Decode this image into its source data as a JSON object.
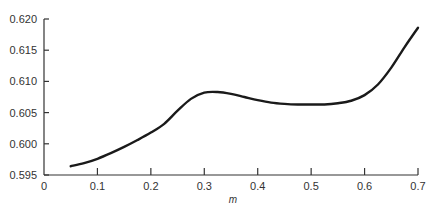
{
  "chart_data": {
    "type": "line",
    "title": "",
    "xlabel": "m",
    "ylabel": "",
    "xlim": [
      0,
      0.7
    ],
    "ylim": [
      0.595,
      0.62
    ],
    "grid": false,
    "legend": null,
    "x_ticks": [
      "0",
      "0.1",
      "0.2",
      "0.3",
      "0.4",
      "0.5",
      "0.6",
      "0.7"
    ],
    "y_ticks": [
      "0.595",
      "0.600",
      "0.605",
      "0.610",
      "0.615",
      "0.620"
    ],
    "series": [
      {
        "name": "curve",
        "color": "#1a1a1a",
        "x": [
          0.05,
          0.075,
          0.1,
          0.125,
          0.15,
          0.175,
          0.2,
          0.225,
          0.25,
          0.275,
          0.3,
          0.325,
          0.35,
          0.375,
          0.4,
          0.425,
          0.45,
          0.475,
          0.5,
          0.525,
          0.55,
          0.575,
          0.6,
          0.625,
          0.65,
          0.675,
          0.7
        ],
        "y": [
          0.5964,
          0.5969,
          0.5976,
          0.5985,
          0.5995,
          0.6006,
          0.6018,
          0.6032,
          0.6053,
          0.6072,
          0.6082,
          0.6083,
          0.608,
          0.6075,
          0.607,
          0.6066,
          0.6064,
          0.6063,
          0.6063,
          0.6063,
          0.6065,
          0.6069,
          0.6078,
          0.6095,
          0.6122,
          0.6155,
          0.6186
        ]
      }
    ]
  }
}
